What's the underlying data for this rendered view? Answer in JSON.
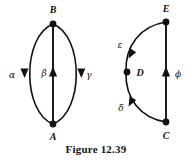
{
  "figure": {
    "caption": "Figure 12.39",
    "stroke_color": "#111111",
    "background_color": "#ffffff",
    "graphs": [
      {
        "id": "left-graph",
        "vertices": [
          {
            "name": "B",
            "label": "B",
            "x": 53,
            "y": 24,
            "label_x": 53,
            "label_y": 12
          },
          {
            "name": "A",
            "label": "A",
            "x": 53,
            "y": 124,
            "label_x": 53,
            "label_y": 138
          }
        ],
        "edges": [
          {
            "name": "alpha-edge",
            "label": "α",
            "label_x": 12,
            "label_y": 75,
            "shape": "curve-left",
            "from": "A",
            "to": "B",
            "arrow_direction": "up"
          },
          {
            "name": "beta-edge",
            "label": "β",
            "label_x": 44,
            "label_y": 75,
            "shape": "straight",
            "from": "A",
            "to": "B",
            "arrow_direction": "up"
          },
          {
            "name": "gamma-edge",
            "label": "γ",
            "label_x": 88,
            "label_y": 75,
            "shape": "curve-right",
            "from": "A",
            "to": "B",
            "arrow_direction": "up"
          }
        ]
      },
      {
        "id": "right-graph",
        "vertices": [
          {
            "name": "E",
            "label": "E",
            "x": 166,
            "y": 22,
            "label_x": 166,
            "label_y": 11
          },
          {
            "name": "D",
            "label": "D",
            "x": 133,
            "y": 72,
            "label_x": 145,
            "label_y": 75
          },
          {
            "name": "C",
            "label": "C",
            "x": 166,
            "y": 122,
            "label_x": 166,
            "label_y": 137
          }
        ],
        "edges": [
          {
            "name": "epsilon-edge",
            "label": "ε",
            "label_x": 120,
            "label_y": 45,
            "shape": "arc-left-upper",
            "from": "D",
            "to": "E",
            "arrow_direction": "up"
          },
          {
            "name": "delta-edge",
            "label": "δ",
            "label_x": 121,
            "label_y": 108,
            "shape": "arc-left-lower",
            "from": "C",
            "to": "D",
            "arrow_direction": "up"
          },
          {
            "name": "phi-edge",
            "label": "ϕ",
            "label_x": 178,
            "label_y": 75,
            "shape": "straight",
            "from": "C",
            "to": "E",
            "arrow_direction": "up"
          }
        ]
      }
    ]
  }
}
